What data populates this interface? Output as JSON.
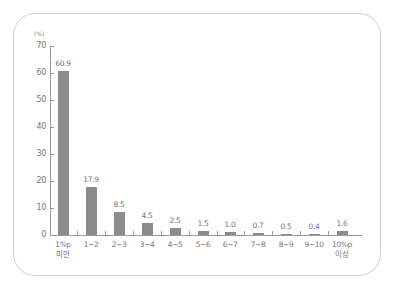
{
  "chart_data": {
    "type": "bar",
    "title": "",
    "xlabel": "",
    "ylabel": "(%)",
    "ylim": [
      0,
      70
    ],
    "yticks": [
      0,
      10,
      20,
      30,
      40,
      50,
      60,
      70
    ],
    "grid": false,
    "legend": null,
    "categories": [
      "1%p 미만",
      "1~2",
      "2~3",
      "3~4",
      "4~5",
      "5~6",
      "6~7",
      "7~8",
      "8~9",
      "9~10",
      "10%p 이상"
    ],
    "category_lines": [
      [
        "1%p",
        "미만"
      ],
      [
        "1~2"
      ],
      [
        "2~3"
      ],
      [
        "3~4"
      ],
      [
        "4~5"
      ],
      [
        "5~6"
      ],
      [
        "6~7"
      ],
      [
        "7~8"
      ],
      [
        "8~9"
      ],
      [
        "9~10"
      ],
      [
        "10%p",
        "이상"
      ]
    ],
    "values": [
      60.9,
      17.9,
      8.5,
      4.5,
      2.5,
      1.5,
      1.0,
      0.7,
      0.5,
      0.4,
      1.6
    ],
    "value_labels": [
      "60.9",
      "17.9",
      "8.5",
      "4.5",
      "2.5",
      "1.5",
      "1.0",
      "0.7",
      "0.5",
      "0.4",
      "1.6"
    ],
    "bar_color": "#8c8c8c"
  }
}
